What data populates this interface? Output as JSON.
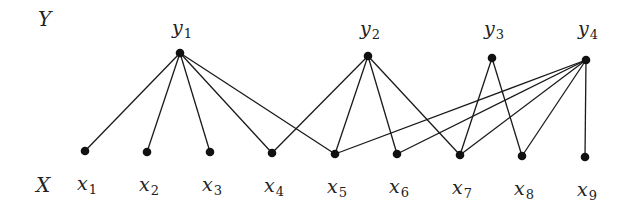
{
  "diagram": {
    "type": "bipartite-graph",
    "sets": {
      "top": {
        "label": "Y",
        "x": 38,
        "y": 26
      },
      "bottom": {
        "label": "X",
        "x": 36,
        "y": 192
      }
    },
    "top_nodes": [
      {
        "id": "y1",
        "base": "y",
        "sub": "1",
        "cx": 180,
        "cy": 53,
        "lx": 172,
        "ly": 34
      },
      {
        "id": "y2",
        "base": "y",
        "sub": "2",
        "cx": 368,
        "cy": 56,
        "lx": 360,
        "ly": 35
      },
      {
        "id": "y3",
        "base": "y",
        "sub": "3",
        "cx": 492,
        "cy": 58,
        "lx": 484,
        "ly": 35
      },
      {
        "id": "y4",
        "base": "y",
        "sub": "4",
        "cx": 586,
        "cy": 60,
        "lx": 578,
        "ly": 35
      }
    ],
    "bottom_nodes": [
      {
        "id": "x1",
        "base": "x",
        "sub": "1",
        "cx": 85,
        "cy": 151,
        "lx": 77,
        "ly": 190
      },
      {
        "id": "x2",
        "base": "x",
        "sub": "2",
        "cx": 147,
        "cy": 152,
        "lx": 139,
        "ly": 191
      },
      {
        "id": "x3",
        "base": "x",
        "sub": "3",
        "cx": 210,
        "cy": 152,
        "lx": 202,
        "ly": 191
      },
      {
        "id": "x4",
        "base": "x",
        "sub": "4",
        "cx": 272,
        "cy": 153,
        "lx": 264,
        "ly": 192
      },
      {
        "id": "x5",
        "base": "x",
        "sub": "5",
        "cx": 335,
        "cy": 154,
        "lx": 327,
        "ly": 193
      },
      {
        "id": "x6",
        "base": "x",
        "sub": "6",
        "cx": 397,
        "cy": 154,
        "lx": 389,
        "ly": 193
      },
      {
        "id": "x7",
        "base": "x",
        "sub": "7",
        "cx": 460,
        "cy": 155,
        "lx": 452,
        "ly": 194
      },
      {
        "id": "x8",
        "base": "x",
        "sub": "8",
        "cx": 522,
        "cy": 156,
        "lx": 514,
        "ly": 195
      },
      {
        "id": "x9",
        "base": "x",
        "sub": "9",
        "cx": 585,
        "cy": 157,
        "lx": 577,
        "ly": 196
      }
    ],
    "edges": [
      [
        "y1",
        "x1"
      ],
      [
        "y1",
        "x2"
      ],
      [
        "y1",
        "x3"
      ],
      [
        "y1",
        "x4"
      ],
      [
        "y1",
        "x5"
      ],
      [
        "y2",
        "x4"
      ],
      [
        "y2",
        "x5"
      ],
      [
        "y2",
        "x6"
      ],
      [
        "y2",
        "x7"
      ],
      [
        "y3",
        "x7"
      ],
      [
        "y3",
        "x8"
      ],
      [
        "y4",
        "x5"
      ],
      [
        "y4",
        "x6"
      ],
      [
        "y4",
        "x7"
      ],
      [
        "y4",
        "x8"
      ],
      [
        "y4",
        "x9"
      ]
    ]
  }
}
